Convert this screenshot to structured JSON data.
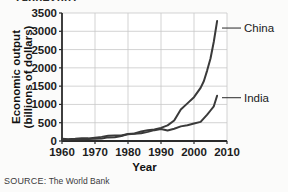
{
  "figure": {
    "title_cropped": "1960–2007",
    "source_prefix": "SOURCE:",
    "source_text": "The World Bank"
  },
  "chart_data": {
    "type": "line",
    "title": "1960–2007",
    "xlabel": "Year",
    "ylabel": "Economic output (billions of dollars)",
    "xlim": [
      1960,
      2010
    ],
    "ylim": [
      0,
      3500
    ],
    "xticks": [
      1960,
      1970,
      1980,
      1990,
      2000,
      2010
    ],
    "yticks": [
      0,
      500,
      1000,
      1500,
      2000,
      2500,
      3000,
      3500
    ],
    "grid": true,
    "legend_position": "right-inline-labels",
    "line_color": "#3a3a3a",
    "grid_color": "#c8c8c8",
    "axis_color": "#2a2a2a",
    "series": [
      {
        "name": "China",
        "x": [
          1960,
          1962,
          1964,
          1966,
          1968,
          1970,
          1972,
          1974,
          1976,
          1978,
          1980,
          1982,
          1984,
          1986,
          1988,
          1990,
          1992,
          1994,
          1996,
          1998,
          2000,
          2002,
          2003,
          2004,
          2005,
          2006,
          2007
        ],
        "values": [
          60,
          48,
          60,
          76,
          72,
          92,
          113,
          144,
          152,
          148,
          189,
          205,
          259,
          297,
          312,
          357,
          426,
          559,
          863,
          1029,
          1198,
          1454,
          1641,
          1932,
          2257,
          2713,
          3280
        ],
        "annotations": [
          {
            "text": "2004 dip",
            "x": 2004,
            "y": 2120
          },
          {
            "text": "2005 rebound",
            "x": 2005,
            "y": 1910
          }
        ]
      },
      {
        "name": "India",
        "x": [
          1960,
          1962,
          1964,
          1966,
          1968,
          1970,
          1972,
          1974,
          1976,
          1978,
          1980,
          1982,
          1984,
          1986,
          1988,
          1990,
          1992,
          1994,
          1996,
          1998,
          2000,
          2002,
          2004,
          2005,
          2006,
          2007
        ],
        "values": [
          37,
          42,
          56,
          46,
          53,
          62,
          71,
          99,
          102,
          137,
          187,
          201,
          212,
          249,
          297,
          327,
          288,
          334,
          400,
          429,
          477,
          523,
          721,
          834,
          949,
          1239
        ]
      }
    ]
  },
  "labels": {
    "china": "China",
    "india": "India",
    "y_axis_line1": "Economic output",
    "y_axis_line2": "(billions of dollars)",
    "x_axis": "Year",
    "yticks": [
      "3500",
      "3000",
      "2500",
      "2000",
      "1500",
      "1000",
      "500",
      "0"
    ],
    "xticks": [
      "1960",
      "1970",
      "1980",
      "1990",
      "2000",
      "2010"
    ]
  }
}
